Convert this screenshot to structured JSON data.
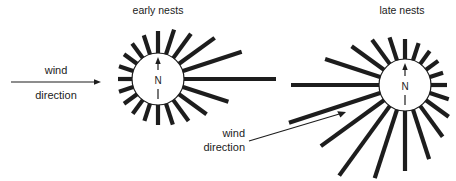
{
  "figure": {
    "title_early": "early nests",
    "title_late": "late nests",
    "compass_label": "N",
    "colors": {
      "ink": "#1d1d1d",
      "background": "#ffffff",
      "petal": "#1d1d1d"
    }
  },
  "annotations": {
    "wind_left": {
      "line1": "wind",
      "line2": "direction"
    },
    "wind_center": {
      "line1": "wind",
      "line2": "direction"
    }
  },
  "chart_data": [
    {
      "type": "rose",
      "title": "early nests",
      "center": [
        158,
        79
      ],
      "hub_radius": 26,
      "north_label": "N",
      "angle_unit": "degrees_clockwise_from_north",
      "categories": [
        0,
        18,
        36,
        54,
        72,
        90,
        108,
        126,
        144,
        162,
        180,
        198,
        216,
        234,
        252,
        270,
        288,
        306,
        324,
        342
      ],
      "values": [
        22,
        26,
        30,
        44,
        62,
        92,
        48,
        34,
        26,
        22,
        20,
        18,
        17,
        16,
        15,
        14,
        15,
        16,
        18,
        20
      ],
      "petal_width": 4.2,
      "notes": "Nest entrance orientations; longest vectors point east / east-north-east, downwind of a westerly wind."
    },
    {
      "type": "rose",
      "title": "late nests",
      "center": [
        405,
        85
      ],
      "hub_radius": 26,
      "north_label": "N",
      "angle_unit": "degrees_clockwise_from_north",
      "categories": [
        0,
        18,
        36,
        54,
        72,
        90,
        108,
        126,
        144,
        162,
        180,
        198,
        216,
        234,
        252,
        270,
        288,
        306,
        324,
        342
      ],
      "values": [
        20,
        18,
        16,
        15,
        14,
        16,
        20,
        28,
        38,
        52,
        60,
        72,
        86,
        78,
        96,
        88,
        58,
        40,
        30,
        24
      ],
      "petal_width": 4.2,
      "notes": "Nest entrance orientations; longest vectors point south-west / west-south-west, downwind of a south-westerly wind."
    }
  ],
  "arrows": [
    {
      "name": "wind-arrow-left",
      "from": [
        11,
        82
      ],
      "to": [
        100,
        82
      ]
    },
    {
      "name": "wind-arrow-center",
      "from": [
        249,
        141
      ],
      "to": [
        345,
        112
      ]
    }
  ]
}
